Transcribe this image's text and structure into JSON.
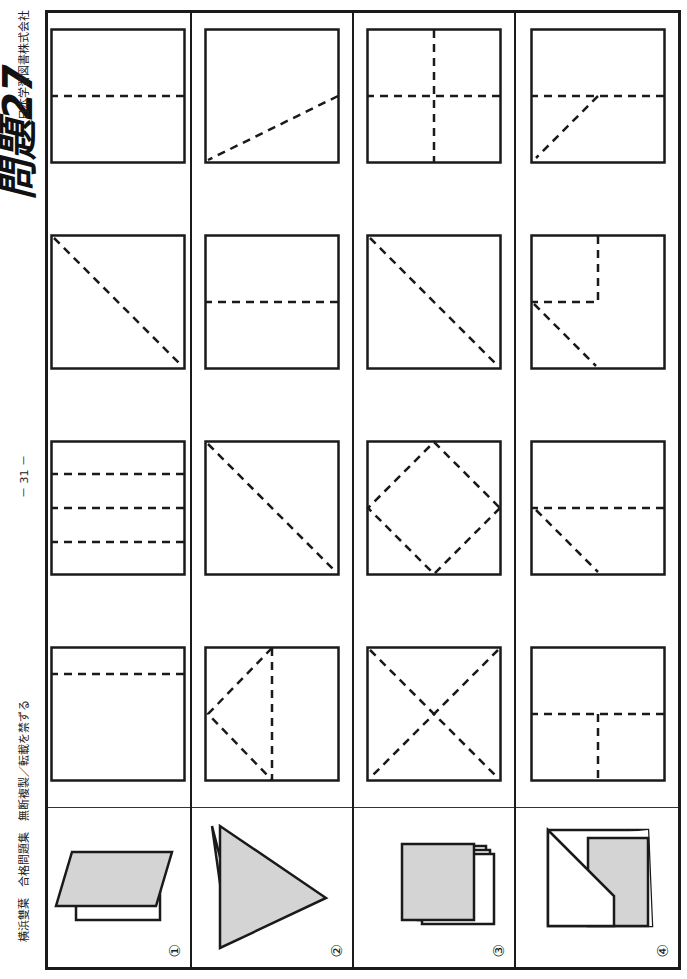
{
  "page": {
    "title": "問題27",
    "page_number": "－ 31 －",
    "footer_left": "横浜雙葉　合格問題集　無断複製／転載を禁ずる",
    "footer_right": "日本学習図書株式会社"
  },
  "rows": [
    {
      "label": "①",
      "example": "paper folded in half with top flap rotated (shaded parallelogram over white rectangle)",
      "choices": [
        {
          "id": "1-1",
          "folds": "horizontal line near top"
        },
        {
          "id": "1-2",
          "folds": "three horizontal lines"
        },
        {
          "id": "1-3",
          "folds": "diagonal bottom-left to top-right"
        },
        {
          "id": "1-4",
          "folds": "horizontal line at middle"
        }
      ]
    },
    {
      "label": "②",
      "example": "triangle folded with white layer underneath",
      "choices": [
        {
          "id": "2-1",
          "folds": "vertical line at middle with V from left"
        },
        {
          "id": "2-2",
          "folds": "diagonal bottom-left to top-right"
        },
        {
          "id": "2-3",
          "folds": "horizontal line at middle"
        },
        {
          "id": "2-4",
          "folds": "diagonal from left-middle to bottom-right"
        }
      ]
    },
    {
      "label": "③",
      "example": "square folded into stacked layers",
      "choices": [
        {
          "id": "3-1",
          "folds": "X both diagonals"
        },
        {
          "id": "3-2",
          "folds": "diamond connecting edge midpoints"
        },
        {
          "id": "3-3",
          "folds": "diagonal bottom-left to top-right"
        },
        {
          "id": "3-4",
          "folds": "cross: horizontal and vertical at middle"
        }
      ]
    },
    {
      "label": "④",
      "example": "rectangle with one corner folded up showing shaded part",
      "choices": [
        {
          "id": "4-1",
          "folds": "horizontal middle plus half vertical from top"
        },
        {
          "id": "4-2",
          "folds": "horizontal middle plus diagonal top-left"
        },
        {
          "id": "4-3",
          "folds": "corner L plus diagonal top-left"
        },
        {
          "id": "4-4",
          "folds": "horizontal middle plus diagonal top-right"
        }
      ]
    }
  ],
  "colors": {
    "line": "#1a1a1a",
    "shade": "#d4d4d4"
  }
}
